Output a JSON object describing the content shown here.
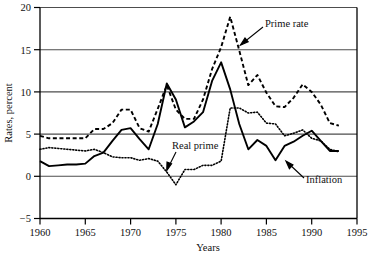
{
  "chart_data": {
    "type": "line",
    "title": "",
    "xlabel": "Years",
    "ylabel": "Rates, percent",
    "xlim": [
      1960,
      1995
    ],
    "ylim": [
      -5,
      20
    ],
    "xticks": [
      1960,
      1965,
      1970,
      1975,
      1980,
      1985,
      1990,
      1995
    ],
    "yticks": [
      -5,
      0,
      5,
      10,
      15,
      20
    ],
    "xtick_labels": [
      "1960",
      "1965",
      "1970",
      "1975",
      "1980",
      "1985",
      "1990",
      "1995"
    ],
    "ytick_labels": [
      "-5",
      "0",
      "5",
      "10",
      "15",
      "20"
    ],
    "grid": "horizontal",
    "legend": "none",
    "x": [
      1960,
      1961,
      1962,
      1963,
      1964,
      1965,
      1966,
      1967,
      1968,
      1969,
      1970,
      1971,
      1972,
      1973,
      1974,
      1975,
      1976,
      1977,
      1978,
      1979,
      1980,
      1981,
      1982,
      1983,
      1984,
      1985,
      1986,
      1987,
      1988,
      1989,
      1990,
      1991,
      1992,
      1993
    ],
    "series": [
      {
        "name": "Prime rate",
        "style": "dashed",
        "color": "#000000",
        "values": [
          4.8,
          4.5,
          4.5,
          4.5,
          4.5,
          4.5,
          5.6,
          5.6,
          6.3,
          7.9,
          7.9,
          5.7,
          5.3,
          8.0,
          10.8,
          7.9,
          6.8,
          6.8,
          9.1,
          12.7,
          15.3,
          18.9,
          14.9,
          10.8,
          12.0,
          9.9,
          8.3,
          8.2,
          9.3,
          10.9,
          10.0,
          8.5,
          6.3,
          6.0
        ],
        "annotation": "Prime rate"
      },
      {
        "name": "Inflation",
        "style": "solid",
        "color": "#000000",
        "values": [
          1.8,
          1.2,
          1.3,
          1.4,
          1.4,
          1.5,
          2.4,
          2.8,
          4.2,
          5.5,
          5.7,
          4.4,
          3.2,
          6.2,
          11.0,
          9.1,
          5.8,
          6.5,
          7.6,
          11.3,
          13.5,
          10.3,
          6.2,
          3.2,
          4.3,
          3.6,
          1.9,
          3.6,
          4.1,
          4.8,
          5.4,
          4.2,
          3.0,
          3.0
        ],
        "annotation": "Inflation"
      },
      {
        "name": "Real prime",
        "style": "dotted",
        "color": "#000000",
        "values": [
          3.2,
          3.4,
          3.3,
          3.2,
          3.1,
          3.0,
          3.2,
          2.8,
          2.3,
          2.2,
          2.2,
          1.9,
          2.1,
          1.8,
          0.5,
          -1.0,
          0.8,
          0.8,
          1.3,
          1.3,
          1.8,
          8.1,
          8.1,
          7.5,
          7.6,
          6.3,
          6.2,
          4.8,
          5.1,
          5.5,
          4.5,
          4.2,
          3.2,
          2.9
        ],
        "annotation": "Real prime"
      }
    ],
    "annotations": [
      {
        "text": "Prime rate",
        "target_year": 1981.5,
        "target_value": 15.6
      },
      {
        "text": "Real prime",
        "target_year": 1974.4,
        "target_value": 0.9
      },
      {
        "text": "Inflation",
        "target_year": 1987.2,
        "target_value": 3.5
      }
    ]
  },
  "labels": {
    "y_axis_title": "Rates, percent",
    "x_axis_title": "Years",
    "prime_rate": "Prime rate",
    "real_prime": "Real prime",
    "inflation": "Inflation"
  },
  "ticks": {
    "y": [
      "20",
      "15",
      "10",
      "5",
      "0",
      "−5"
    ],
    "x": [
      "1960",
      "1965",
      "1970",
      "1975",
      "1980",
      "1985",
      "1990",
      "1995"
    ]
  },
  "colors": {
    "axis": "#000000",
    "grid": "#555555",
    "background": "#ffffff",
    "series": "#000000"
  }
}
